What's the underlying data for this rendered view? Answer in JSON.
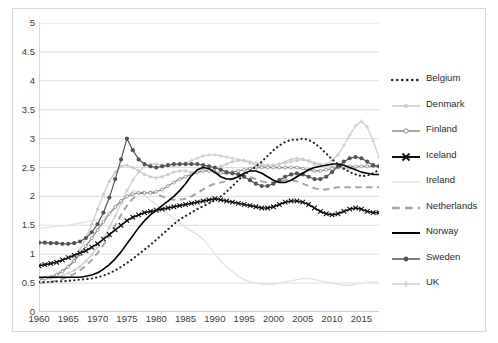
{
  "chart_data": {
    "type": "line",
    "title": "",
    "subtitle": "",
    "xlabel": "",
    "ylabel": "",
    "xlim": [
      1960,
      2018
    ],
    "ylim": [
      0,
      5
    ],
    "ytick_labels": [
      "0",
      "0.5",
      "1",
      "1.5",
      "2",
      "2.5",
      "3",
      "3.5",
      "4",
      "4.5",
      "5"
    ],
    "ytick_values": [
      0,
      0.5,
      1,
      1.5,
      2,
      2.5,
      3,
      3.5,
      4,
      4.5,
      5
    ],
    "xtick_labels": [
      "1960",
      "1965",
      "1970",
      "1975",
      "1980",
      "1985",
      "1990",
      "1995",
      "2000",
      "2005",
      "2010",
      "2015"
    ],
    "xtick_values": [
      1960,
      1965,
      1970,
      1975,
      1980,
      1985,
      1990,
      1995,
      2000,
      2005,
      2010,
      2015
    ],
    "grid": "horizontal",
    "legend_position": "right",
    "x": [
      1960,
      1961,
      1962,
      1963,
      1964,
      1965,
      1966,
      1967,
      1968,
      1969,
      1970,
      1971,
      1972,
      1973,
      1974,
      1975,
      1976,
      1977,
      1978,
      1979,
      1980,
      1981,
      1982,
      1983,
      1984,
      1985,
      1986,
      1987,
      1988,
      1989,
      1990,
      1991,
      1992,
      1993,
      1994,
      1995,
      1996,
      1997,
      1998,
      1999,
      2000,
      2001,
      2002,
      2003,
      2004,
      2005,
      2006,
      2007,
      2008,
      2009,
      2010,
      2011,
      2012,
      2013,
      2014,
      2015,
      2016,
      2017,
      2018
    ],
    "series": [
      {
        "name": "Belgium",
        "color": "#252525",
        "style": "dotted",
        "marker": "none",
        "values": [
          0.52,
          0.52,
          0.52,
          0.53,
          0.53,
          0.54,
          0.55,
          0.56,
          0.57,
          0.58,
          0.6,
          0.63,
          0.67,
          0.72,
          0.78,
          0.85,
          0.92,
          1.0,
          1.08,
          1.16,
          1.25,
          1.34,
          1.43,
          1.52,
          1.6,
          1.66,
          1.72,
          1.78,
          1.83,
          1.88,
          1.93,
          2.0,
          2.08,
          2.18,
          2.28,
          2.38,
          2.44,
          2.52,
          2.6,
          2.7,
          2.8,
          2.88,
          2.94,
          2.98,
          2.98,
          3.0,
          2.98,
          2.92,
          2.84,
          2.74,
          2.64,
          2.56,
          2.48,
          2.42,
          2.38,
          2.35,
          2.36,
          2.4,
          2.46
        ]
      },
      {
        "name": "Denmark",
        "color": "#cccccc",
        "style": "solid",
        "marker": "circle",
        "values": [
          0.58,
          0.6,
          0.62,
          0.66,
          0.72,
          0.8,
          0.92,
          1.08,
          1.28,
          1.52,
          1.78,
          2.04,
          2.26,
          2.42,
          2.52,
          2.54,
          2.5,
          2.44,
          2.38,
          2.34,
          2.32,
          2.34,
          2.38,
          2.42,
          2.44,
          2.44,
          2.42,
          2.42,
          2.44,
          2.46,
          2.48,
          2.52,
          2.56,
          2.6,
          2.62,
          2.62,
          2.58,
          2.54,
          2.52,
          2.52,
          2.54,
          2.56,
          2.58,
          2.6,
          2.62,
          2.64,
          2.62,
          2.58,
          2.56,
          2.54,
          2.52,
          2.5,
          2.48,
          2.48,
          2.5,
          2.52,
          2.52,
          2.52,
          2.52
        ]
      },
      {
        "name": "Finland",
        "color": "#8c8c8c",
        "style": "solid",
        "marker": "circle-open",
        "values": [
          0.56,
          0.58,
          0.6,
          0.64,
          0.7,
          0.78,
          0.88,
          1.0,
          1.14,
          1.28,
          1.42,
          1.56,
          1.7,
          1.82,
          1.92,
          2.0,
          2.04,
          2.06,
          2.06,
          2.06,
          2.08,
          2.12,
          2.18,
          2.24,
          2.3,
          2.34,
          2.38,
          2.42,
          2.44,
          2.44,
          2.42,
          2.4,
          2.4,
          2.42,
          2.44,
          2.46,
          2.48,
          2.5,
          2.5,
          2.5,
          2.5,
          2.5,
          2.5,
          2.5,
          2.5,
          2.48,
          2.46,
          2.44,
          2.44,
          2.46,
          2.48,
          2.5,
          2.52,
          2.52,
          2.52,
          2.52,
          2.52,
          2.52,
          2.52
        ]
      },
      {
        "name": "Iceland",
        "color": "#111111",
        "style": "solid",
        "marker": "x",
        "values": [
          0.8,
          0.82,
          0.84,
          0.86,
          0.9,
          0.94,
          0.98,
          1.02,
          1.06,
          1.12,
          1.18,
          1.26,
          1.34,
          1.42,
          1.5,
          1.58,
          1.64,
          1.68,
          1.72,
          1.74,
          1.76,
          1.78,
          1.8,
          1.82,
          1.84,
          1.86,
          1.88,
          1.9,
          1.92,
          1.94,
          1.96,
          1.94,
          1.92,
          1.9,
          1.88,
          1.86,
          1.84,
          1.82,
          1.8,
          1.8,
          1.82,
          1.86,
          1.9,
          1.92,
          1.92,
          1.9,
          1.86,
          1.8,
          1.74,
          1.7,
          1.68,
          1.7,
          1.74,
          1.78,
          1.8,
          1.78,
          1.74,
          1.72,
          1.72
        ]
      },
      {
        "name": "Ireland",
        "color": "#e2e2e2",
        "style": "solid",
        "marker": "none",
        "values": [
          1.45,
          1.46,
          1.47,
          1.48,
          1.49,
          1.5,
          1.52,
          1.54,
          1.56,
          1.58,
          1.6,
          1.64,
          1.7,
          1.78,
          1.88,
          2.0,
          2.1,
          2.08,
          2.02,
          1.94,
          1.86,
          1.78,
          1.7,
          1.62,
          1.54,
          1.46,
          1.4,
          1.34,
          1.26,
          1.14,
          1.0,
          0.88,
          0.78,
          0.7,
          0.62,
          0.56,
          0.52,
          0.5,
          0.48,
          0.48,
          0.48,
          0.5,
          0.52,
          0.54,
          0.56,
          0.58,
          0.58,
          0.56,
          0.54,
          0.52,
          0.5,
          0.48,
          0.46,
          0.46,
          0.48,
          0.5,
          0.52,
          0.52,
          0.52
        ]
      },
      {
        "name": "Netherlands",
        "color": "#a5a5a5",
        "style": "dashed",
        "marker": "none",
        "values": [
          0.5,
          0.51,
          0.52,
          0.54,
          0.57,
          0.61,
          0.66,
          0.72,
          0.8,
          0.9,
          1.02,
          1.16,
          1.32,
          1.5,
          1.68,
          1.84,
          1.96,
          2.04,
          2.08,
          2.08,
          2.04,
          2.0,
          1.96,
          1.94,
          1.94,
          1.96,
          2.0,
          2.06,
          2.12,
          2.18,
          2.22,
          2.24,
          2.26,
          2.3,
          2.34,
          2.36,
          2.34,
          2.3,
          2.26,
          2.24,
          2.24,
          2.26,
          2.28,
          2.28,
          2.26,
          2.22,
          2.18,
          2.14,
          2.12,
          2.12,
          2.14,
          2.16,
          2.16,
          2.16,
          2.16,
          2.16,
          2.16,
          2.16,
          2.16
        ]
      },
      {
        "name": "Norway",
        "color": "#000000",
        "style": "solid",
        "marker": "none",
        "values": [
          0.6,
          0.6,
          0.6,
          0.6,
          0.6,
          0.6,
          0.6,
          0.6,
          0.62,
          0.64,
          0.68,
          0.74,
          0.82,
          0.92,
          1.04,
          1.18,
          1.32,
          1.46,
          1.58,
          1.68,
          1.76,
          1.84,
          1.92,
          2.0,
          2.1,
          2.22,
          2.36,
          2.46,
          2.5,
          2.48,
          2.42,
          2.34,
          2.3,
          2.3,
          2.34,
          2.4,
          2.44,
          2.44,
          2.4,
          2.34,
          2.28,
          2.24,
          2.24,
          2.28,
          2.34,
          2.4,
          2.46,
          2.5,
          2.52,
          2.54,
          2.56,
          2.56,
          2.54,
          2.5,
          2.46,
          2.42,
          2.4,
          2.38,
          2.38
        ]
      },
      {
        "name": "Sweden",
        "color": "#545454",
        "style": "solid",
        "marker": "circle-filled",
        "values": [
          1.2,
          1.2,
          1.19,
          1.19,
          1.18,
          1.18,
          1.19,
          1.22,
          1.28,
          1.38,
          1.52,
          1.72,
          1.98,
          2.3,
          2.64,
          3.0,
          2.8,
          2.64,
          2.56,
          2.52,
          2.5,
          2.52,
          2.54,
          2.56,
          2.56,
          2.56,
          2.56,
          2.56,
          2.54,
          2.52,
          2.5,
          2.46,
          2.42,
          2.4,
          2.38,
          2.34,
          2.28,
          2.22,
          2.18,
          2.18,
          2.22,
          2.28,
          2.34,
          2.38,
          2.4,
          2.38,
          2.34,
          2.3,
          2.3,
          2.34,
          2.42,
          2.52,
          2.6,
          2.66,
          2.68,
          2.66,
          2.6,
          2.54,
          2.52
        ]
      },
      {
        "name": "UK",
        "color": "#d0d0d0",
        "style": "solid",
        "marker": "plus",
        "values": [
          0.56,
          0.57,
          0.58,
          0.6,
          0.63,
          0.67,
          0.72,
          0.79,
          0.88,
          0.99,
          1.12,
          1.28,
          1.46,
          1.66,
          1.88,
          2.1,
          2.28,
          2.42,
          2.52,
          2.56,
          2.56,
          2.54,
          2.52,
          2.52,
          2.54,
          2.58,
          2.62,
          2.66,
          2.7,
          2.72,
          2.72,
          2.7,
          2.68,
          2.66,
          2.64,
          2.62,
          2.6,
          2.58,
          2.56,
          2.54,
          2.54,
          2.56,
          2.6,
          2.64,
          2.66,
          2.64,
          2.6,
          2.56,
          2.54,
          2.56,
          2.62,
          2.72,
          2.88,
          3.06,
          3.22,
          3.3,
          3.2,
          2.96,
          2.68
        ]
      }
    ]
  },
  "legend": {
    "items": [
      {
        "label": "Belgium"
      },
      {
        "label": "Denmark"
      },
      {
        "label": "Finland"
      },
      {
        "label": "Iceland"
      },
      {
        "label": "Ireland"
      },
      {
        "label": "Netherlands"
      },
      {
        "label": "Norway"
      },
      {
        "label": "Sweden"
      },
      {
        "label": "UK"
      }
    ]
  }
}
